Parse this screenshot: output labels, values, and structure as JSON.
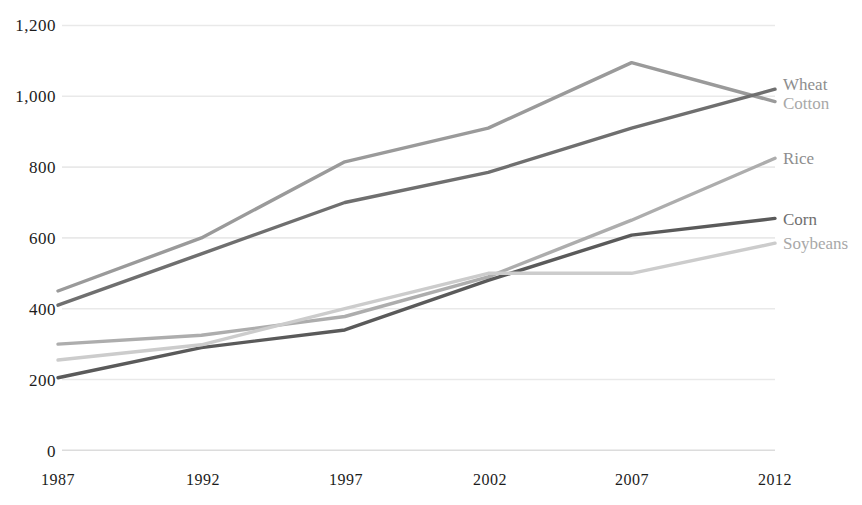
{
  "chart_data": {
    "type": "line",
    "title": "",
    "subtitle": "",
    "xlabel": "",
    "ylabel": "",
    "x": [
      1987,
      1992,
      1997,
      2002,
      2007,
      2012
    ],
    "categories": [
      "1987",
      "1992",
      "1997",
      "2002",
      "2007",
      "2012"
    ],
    "xlim": [
      1987,
      2012
    ],
    "ylim": [
      0,
      1200
    ],
    "y_ticks": [
      0,
      200,
      400,
      600,
      800,
      1000,
      1200
    ],
    "y_tick_labels": [
      "0",
      "200",
      "400",
      "600",
      "800",
      "1,000",
      "1,200"
    ],
    "grid": "horizontal",
    "legend_position": "right-inline-labels",
    "series": [
      {
        "name": "Cotton",
        "color": "#9a9a9a",
        "values": [
          450,
          600,
          815,
          910,
          1095,
          985
        ]
      },
      {
        "name": "Wheat",
        "color": "#6f6f6f",
        "values": [
          410,
          555,
          700,
          785,
          910,
          1020
        ]
      },
      {
        "name": "Rice",
        "color": "#adadad",
        "values": [
          300,
          325,
          378,
          490,
          650,
          825
        ]
      },
      {
        "name": "Corn",
        "color": "#5a5a5a",
        "values": [
          205,
          290,
          340,
          480,
          608,
          655
        ]
      },
      {
        "name": "Soybeans",
        "color": "#cccccc",
        "values": [
          255,
          298,
          400,
          500,
          500,
          585
        ]
      }
    ],
    "annotations": [
      {
        "text": "Wheat",
        "series": "Wheat"
      },
      {
        "text": "Cotton",
        "series": "Cotton"
      },
      {
        "text": "Rice",
        "series": "Rice"
      },
      {
        "text": "Corn",
        "series": "Corn"
      },
      {
        "text": "Soybeans",
        "series": "Soybeans"
      }
    ]
  },
  "axis": {
    "y_labels": [
      "1,200",
      "1,000",
      "800",
      "600",
      "400",
      "200",
      "0"
    ],
    "x_labels": [
      "1987",
      "1992",
      "1997",
      "2002",
      "2007",
      "2012"
    ]
  },
  "labels": {
    "wheat": "Wheat",
    "cotton": "Cotton",
    "rice": "Rice",
    "corn": "Corn",
    "soybeans": "Soybeans"
  },
  "colors": {
    "gridline": "#e9e9e9",
    "text": "#1c1c1c",
    "label_text": "#8d8d8d",
    "background": "#ffffff"
  }
}
